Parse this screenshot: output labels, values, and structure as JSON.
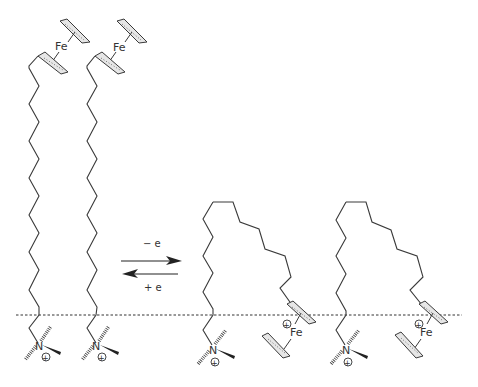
{
  "figure": {
    "type": "chemical-scheme"
  },
  "labels": {
    "iron": "Fe",
    "nitrogen": "N",
    "oxidation": "− e",
    "reduction": "+ e",
    "positive_charge": "+"
  },
  "molecules": [
    {
      "state": "reduced",
      "ferrocene_charge": "neutral",
      "conformation": "extended"
    },
    {
      "state": "reduced",
      "ferrocene_charge": "neutral",
      "conformation": "extended"
    },
    {
      "state": "oxidized",
      "ferrocene_charge": "+",
      "conformation": "looped"
    },
    {
      "state": "oxidized",
      "ferrocene_charge": "+",
      "conformation": "looped"
    }
  ],
  "colors": {
    "line": "#3a3a3a",
    "ring_fill": "#e6e6e6",
    "background": "#ffffff"
  }
}
